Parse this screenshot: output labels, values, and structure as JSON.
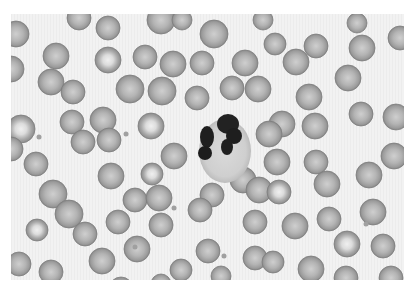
{
  "image": {
    "subject": "peripheral blood smear micrograph",
    "description": "Grayscale light micrograph showing a segmented neutrophil surrounded by red blood cells",
    "palette": {
      "background": "#f1f1f1",
      "rbc_edge": "#8a8a8a",
      "rbc_body": "#a9a9a9",
      "rbc_center": "#cdcdcd",
      "nucleus": "#1e1e1e",
      "cytoplasm": "#d6d6d6",
      "platelet": "#9a9a9a"
    },
    "cells": {
      "neutrophil_count": 1,
      "neutrophil_nucleus_lobes": 4
    }
  }
}
